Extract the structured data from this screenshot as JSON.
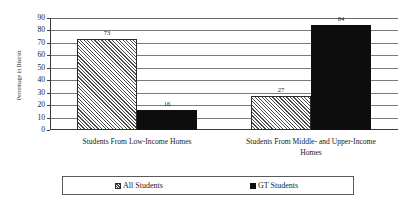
{
  "chart_data": {
    "type": "bar",
    "title": "",
    "xlabel": "",
    "ylabel": "Percentage in District",
    "ylim": [
      0,
      90
    ],
    "ytick_step": 10,
    "yticks": [
      90,
      80,
      70,
      60,
      50,
      40,
      30,
      20,
      10,
      0
    ],
    "grid": true,
    "legend_position": "bottom",
    "categories": [
      "Students From Low-Income Homes",
      "Students From Middle- and Upper-Income Homes"
    ],
    "series": [
      {
        "name": "All Students",
        "fill": "hatched",
        "values": [
          73,
          27
        ]
      },
      {
        "name": "GT Students",
        "fill": "solid",
        "values": [
          16,
          84
        ]
      }
    ]
  },
  "colors": {
    "axis": "#3a3a3a",
    "gridline": "#7a7a7a",
    "hatch": "#4a4a4a",
    "solid": "#0d0d0d",
    "text": "#1a1a1a",
    "background": "#ffffff"
  },
  "category_lines": [
    [
      "Students From Low-Income Homes"
    ],
    [
      "Students From Middle- and Upper-Income",
      "Homes"
    ]
  ],
  "legend": {
    "items": [
      {
        "label": "All Students",
        "fill": "hatched"
      },
      {
        "label": "GT Students",
        "fill": "solid"
      }
    ]
  }
}
